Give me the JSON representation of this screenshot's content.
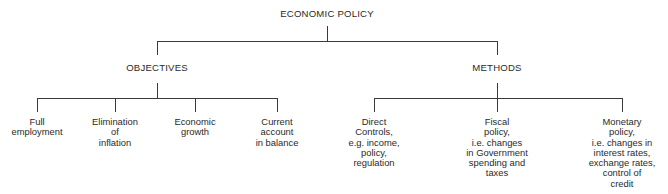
{
  "diagram": {
    "root": {
      "label": "ECONOMIC POLICY"
    },
    "branches": [
      {
        "label": "OBJECTIVES",
        "children": [
          {
            "lines": [
              "Full",
              "employment"
            ]
          },
          {
            "lines": [
              "Elimination",
              "of",
              "inflation"
            ]
          },
          {
            "lines": [
              "Economic",
              "growth"
            ]
          },
          {
            "lines": [
              "Current",
              "account",
              "in balance"
            ]
          }
        ]
      },
      {
        "label": "METHODS",
        "children": [
          {
            "lines": [
              "Direct",
              "Controls,",
              "e.g. income,",
              "policy,",
              "regulation"
            ]
          },
          {
            "lines": [
              "Fiscal",
              "policy,",
              "i.e. changes",
              "in Government",
              "spending and",
              "taxes"
            ]
          },
          {
            "lines": [
              "Monetary",
              "policy,",
              "i.e. changes in",
              "interest rates,",
              "exchange rates,",
              "control of",
              "credit"
            ]
          }
        ]
      }
    ]
  }
}
